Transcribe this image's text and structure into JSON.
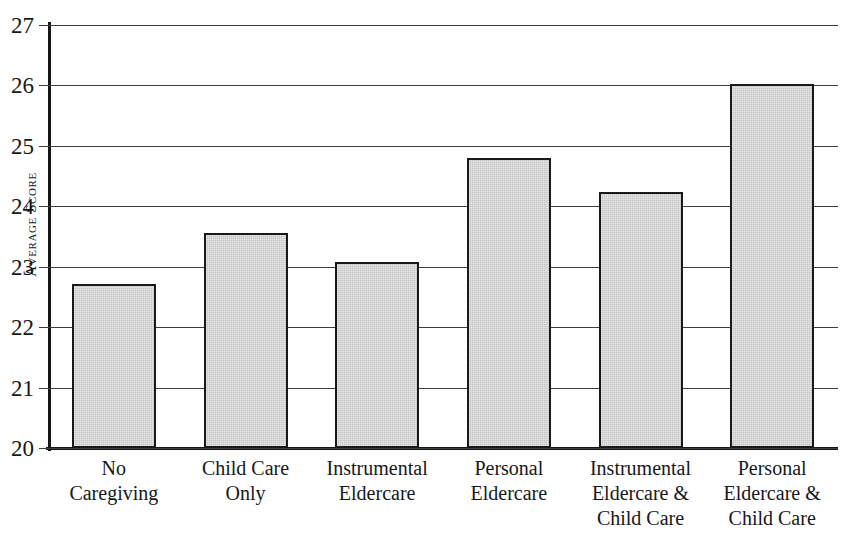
{
  "chart_data": {
    "type": "bar",
    "title": "",
    "xlabel": "",
    "ylabel": "Average Score",
    "ylim": [
      20,
      27
    ],
    "ytick_step": 1,
    "yticks": [
      27,
      26,
      25,
      24,
      23,
      22,
      21,
      20
    ],
    "grid": true,
    "legend": "none",
    "categories": [
      "No Caregiving",
      "Child Care Only",
      "Instrumental Eldercare",
      "Personal Eldercare",
      "Instrumental Eldercare & Child Care",
      "Personal Eldercare & Child Care"
    ],
    "category_label_lines": [
      [
        "No",
        "Caregiving"
      ],
      [
        "Child Care",
        "Only"
      ],
      [
        "Instrumental",
        "Eldercare"
      ],
      [
        "Personal",
        "Eldercare"
      ],
      [
        "Instrumental",
        "Eldercare &",
        "Child Care"
      ],
      [
        "Personal",
        "Eldercare &",
        "Child Care"
      ]
    ],
    "values": [
      22.72,
      23.55,
      23.08,
      24.8,
      24.23,
      26.02
    ],
    "bar_fill_color": "#c5c5c5",
    "bar_border_color": "#18191c",
    "axis_color": "#15161a",
    "grid_color": "#3c3d40",
    "background_color": "#ffffff"
  }
}
